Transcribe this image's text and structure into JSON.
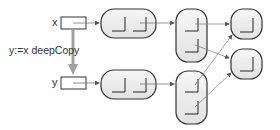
{
  "variables": [
    {
      "name": "x",
      "x": 52,
      "y": 16
    },
    {
      "name": "y",
      "x": 52,
      "y": 76
    }
  ],
  "operation": {
    "label": "y:=x deepCopy"
  },
  "colors": {
    "stroke": "#333333",
    "fill": "#ececec",
    "arrow": "#9a9a9a",
    "copyArrow": "#a0a0a0"
  }
}
